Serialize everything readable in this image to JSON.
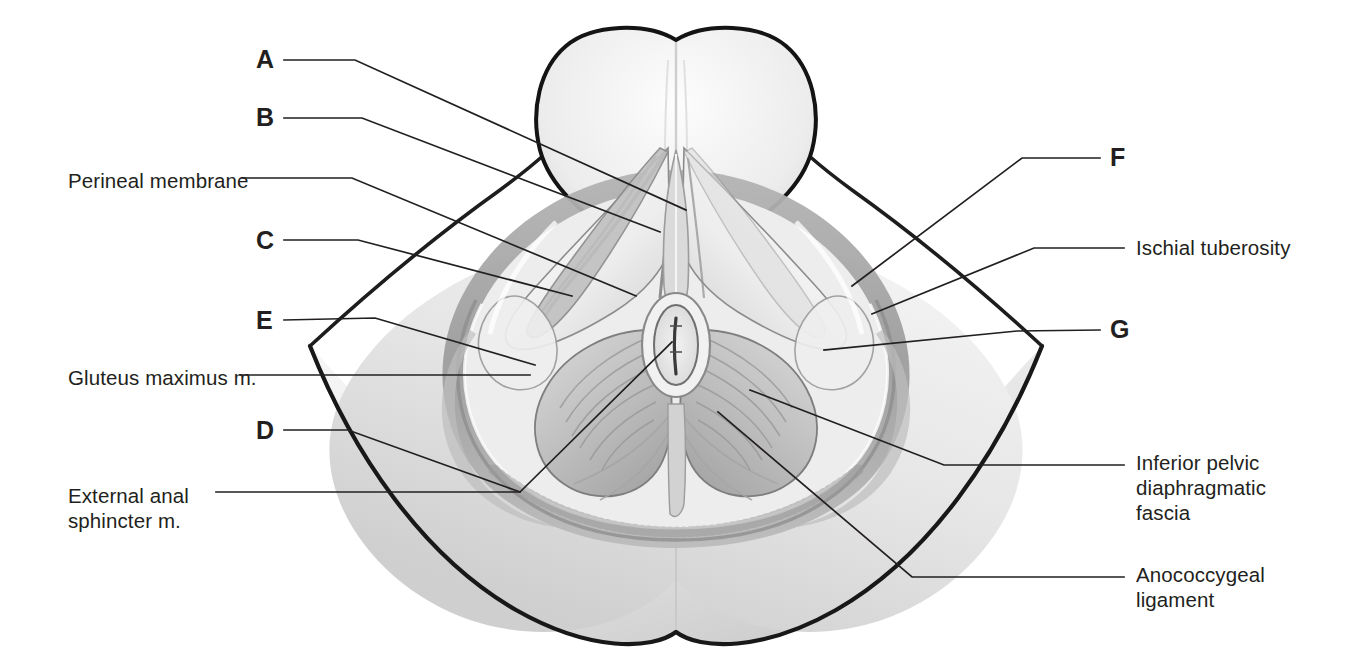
{
  "figure": {
    "line_color": "#231f20",
    "text_color": "#231f20",
    "background": "#ffffff"
  },
  "labels": {
    "left": [
      {
        "id": "A",
        "text": "A",
        "kind": "letter",
        "x": 256,
        "y": 47
      },
      {
        "id": "B",
        "text": "B",
        "kind": "letter",
        "x": 256,
        "y": 105
      },
      {
        "id": "perineal_membrane",
        "text": "Perineal membrane",
        "kind": "name",
        "x": 68,
        "y": 168
      },
      {
        "id": "C",
        "text": "C",
        "kind": "letter",
        "x": 256,
        "y": 228
      },
      {
        "id": "E",
        "text": "E",
        "kind": "letter",
        "x": 256,
        "y": 308
      },
      {
        "id": "gluteus_maximus",
        "text": "Gluteus maximus m.",
        "kind": "name",
        "x": 68,
        "y": 365
      },
      {
        "id": "D",
        "text": "D",
        "kind": "letter",
        "x": 256,
        "y": 418
      },
      {
        "id": "external_anal_sphincter",
        "text": "External anal\nsphincter m.",
        "kind": "name",
        "x": 68,
        "y": 483
      }
    ],
    "right": [
      {
        "id": "F",
        "text": "F",
        "kind": "letter",
        "x": 1110,
        "y": 145
      },
      {
        "id": "ischial_tuberosity",
        "text": "Ischial tuberosity",
        "kind": "name",
        "x": 1136,
        "y": 235
      },
      {
        "id": "G",
        "text": "G",
        "kind": "letter",
        "x": 1110,
        "y": 317
      },
      {
        "id": "inferior_pelvic_diaphragmatic_fascia",
        "text": "Inferior pelvic\ndiaphragmatic\nfascia",
        "kind": "name",
        "x": 1136,
        "y": 450
      },
      {
        "id": "anococcygeal_ligament",
        "text": "Anococcygeal\nligament",
        "kind": "name",
        "x": 1136,
        "y": 562
      }
    ]
  },
  "leaders": [
    {
      "id": "leader-A",
      "points": "284,60 355,60 686,210"
    },
    {
      "id": "leader-B",
      "points": "284,118 362,118 660,232"
    },
    {
      "id": "leader-perineal-membrane",
      "points": "242,178 352,178 636,296"
    },
    {
      "id": "leader-C",
      "points": "284,240 358,240 572,296"
    },
    {
      "id": "leader-E",
      "points": "284,320 375,318 535,365"
    },
    {
      "id": "leader-gluteus",
      "points": "240,375 530,375"
    },
    {
      "id": "leader-D",
      "points": "284,430 348,430 520,492"
    },
    {
      "id": "leader-external-anal-sphincter",
      "points": "216,492 520,492 672,342"
    },
    {
      "id": "leader-F",
      "points": "1100,158 1022,158 852,286"
    },
    {
      "id": "leader-ischial-tuberosity",
      "points": "1124,248 1034,248 872,314"
    },
    {
      "id": "leader-G",
      "points": "1100,330 1017,331 824,350"
    },
    {
      "id": "leader-inferior-pelvic-fascia",
      "points": "1124,465 944,465 750,390"
    },
    {
      "id": "leader-anococcygeal",
      "points": "1124,577 912,577 718,412"
    }
  ],
  "structures": {
    "outer_body_outline": "Buttocks and thigh silhouette",
    "anal_opening": "Anus",
    "ischioanal_fossa": "Ischioanal fossa fat pad",
    "levator_ani": "Levator ani muscle sheet",
    "genital_root": "Scrotal / genital root at top"
  },
  "palette": {
    "outline_dark": "#1a1a1a",
    "skin_light": "#f3f3f3",
    "skin_mid": "#dcdcdc",
    "muscle_mid": "#c6c6c6",
    "muscle_dark": "#a9a9a9",
    "shadow": "#8e8e8e",
    "fat_band": "#b8b8b8",
    "white": "#ffffff"
  }
}
